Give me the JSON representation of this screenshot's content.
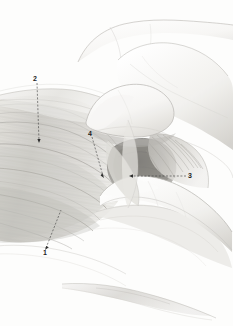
{
  "figure": {
    "kind": "anatomical-illustration",
    "medium": "graphite-pencil-rendering",
    "width": 233,
    "height": 326,
    "background_color": "#fdfdfc"
  },
  "palette": {
    "paper": "#fdfdfc",
    "line_light": "#cfcfcf",
    "line_mid": "#9a9a9a",
    "line_dark": "#4a4a4a",
    "label_text": "#1c1c1c",
    "leader_line": "#3a3a3a",
    "tissue_light": "#ededea",
    "tissue_mid": "#cfcdc8",
    "tissue_dark": "#9e9c97",
    "shadow_deep": "#6e6c68",
    "skin_light": "#fbfbfa",
    "skin_shade": "#d9d7d3"
  },
  "labels": [
    {
      "id": "label-1",
      "text": "1",
      "x": 43,
      "y": 249,
      "leader": {
        "x1": 46,
        "y1": 248,
        "x2": 61,
        "y2": 210,
        "style": "dashed",
        "arrow": "start"
      }
    },
    {
      "id": "label-2",
      "text": "2",
      "x": 33,
      "y": 75,
      "leader": {
        "x1": 37,
        "y1": 83,
        "x2": 39,
        "y2": 141,
        "style": "dashed",
        "arrow": "end"
      }
    },
    {
      "id": "label-3",
      "text": "3",
      "x": 188,
      "y": 172,
      "leader": {
        "x1": 186,
        "y1": 176,
        "x2": 131,
        "y2": 176,
        "style": "dashed",
        "arrow": "end"
      }
    },
    {
      "id": "label-4",
      "text": "4",
      "x": 88,
      "y": 130,
      "leader": {
        "x1": 92,
        "y1": 137,
        "x2": 103,
        "y2": 176,
        "style": "dashed",
        "arrow": "end"
      }
    }
  ],
  "regions": [
    {
      "name": "muscle-belly-left",
      "description": "large striated muscle mass occupying left half"
    },
    {
      "name": "fascial-sheet-upper",
      "description": "thin fascial band crossing upper left"
    },
    {
      "name": "retracting-hand",
      "description": "gloved hand and fingers entering from right"
    },
    {
      "name": "index-finger",
      "description": "upper finger pressing tissue at center"
    },
    {
      "name": "middle-finger",
      "description": "lower finger retracting tissue toward lower right"
    },
    {
      "name": "deep-cavity",
      "description": "dark shaded dissection plane at center right"
    },
    {
      "name": "tendon-strands",
      "description": "fan of fine tendinous fibers right of cavity"
    },
    {
      "name": "instrument-tip",
      "description": "slender instrument shaft crossing bottom"
    }
  ]
}
